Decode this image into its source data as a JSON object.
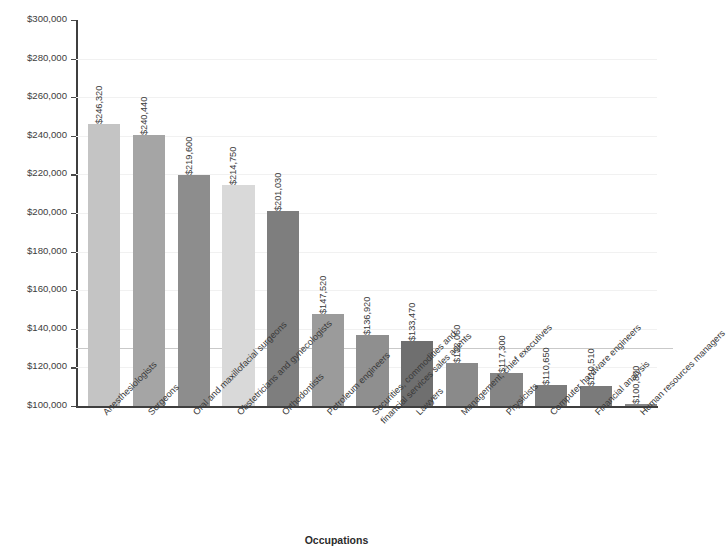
{
  "chart_data": {
    "type": "bar",
    "title": "",
    "xlabel": "Occupations",
    "ylabel": "2014 mean annual wages",
    "ylim": [
      100000,
      300000
    ],
    "ytick_step": 20000,
    "grid": true,
    "legend": "none",
    "value_label_rotation": 90,
    "category_label_rotation": 45,
    "ytick_labels": [
      "$300,000",
      "$280,000",
      "$260,000",
      "$240,000",
      "$220,000",
      "$200,000",
      "$180,000",
      "$160,000",
      "$140,000",
      "$120,000",
      "$100,000"
    ],
    "ytick_values": [
      300000,
      280000,
      260000,
      240000,
      220000,
      200000,
      180000,
      160000,
      140000,
      120000,
      100000
    ],
    "emphasis_line_value": 130000,
    "categories": [
      "Anesthesiologists",
      "Surgeons",
      "Oral and maxillofacial surgeons",
      "Obstetricians and gynecologists",
      "Orthodontists",
      "Petroleum engineers",
      "Securities, commodities and financial services sales agents",
      "Lawyers",
      "Management, chief executives",
      "Physicists",
      "Computer hardware engineers",
      "Financial analysis",
      "Human resources managers"
    ],
    "category_lines": [
      [
        "Anesthesiologists"
      ],
      [
        "Surgeons"
      ],
      [
        "Oral and maxillofacial surgeons"
      ],
      [
        "Obstetricians and gynecologists"
      ],
      [
        "Orthodontists"
      ],
      [
        "Petroleum engineers"
      ],
      [
        "Securities, commodities and",
        "financial services sales agents"
      ],
      [
        "Lawyers"
      ],
      [
        "Management, chief executives"
      ],
      [
        "Physicists"
      ],
      [
        "Computer hardware engineers"
      ],
      [
        "Financial analysis"
      ],
      [
        "Human resources managers"
      ]
    ],
    "values": [
      246320,
      240440,
      219600,
      214750,
      201030,
      147520,
      136920,
      133470,
      122060,
      117300,
      110650,
      110510,
      100800
    ],
    "value_labels": [
      "$246,320",
      "$240,440",
      "$219,600",
      "$214,750",
      "$201,030",
      "$147,520",
      "$136,920",
      "$133,470",
      "$122,060",
      "$117,300",
      "$110,650",
      "$110,510",
      "$100,800"
    ],
    "bar_colors": [
      "#c4c4c4",
      "#a5a5a5",
      "#8d8d8d",
      "#d9d9d9",
      "#7e7e7e",
      "#9b9b9b",
      "#8f8f8f",
      "#6f6f6f",
      "#8a8a8a",
      "#858585",
      "#7c7c7c",
      "#7a7a7a",
      "#888888"
    ]
  },
  "colors": {
    "background": "#ffffff",
    "axis": "#3f3f3f",
    "gridline": "#f1f1f1",
    "gridline_major": "#c9c9c9",
    "text": "#3a3a3a"
  }
}
